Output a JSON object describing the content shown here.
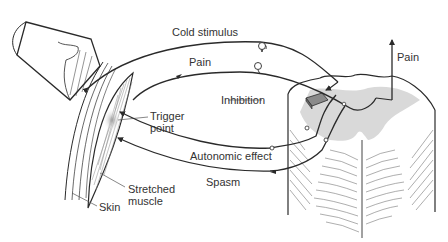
{
  "diagram": {
    "type": "anatomical-pathway-diagram",
    "labels": {
      "cold_stimulus": "Cold stimulus",
      "pain_afferent": "Pain",
      "pain_ascending": "Pain",
      "inhibition": "Inhibition",
      "trigger_point_line1": "Trigger",
      "trigger_point_line2": "point",
      "autonomic_effect": "Autonomic effect",
      "spasm": "Spasm",
      "stretched_muscle_line1": "Stretched",
      "stretched_muscle_line2": "muscle",
      "skin": "Skin"
    },
    "nodes": [
      {
        "id": "ice-cup",
        "label": ""
      },
      {
        "id": "skin",
        "label": "Skin"
      },
      {
        "id": "stretched-muscle",
        "label": "Stretched muscle"
      },
      {
        "id": "trigger-point",
        "label": "Trigger point"
      },
      {
        "id": "spinal-cord",
        "label": ""
      },
      {
        "id": "inhibition-interneuron",
        "label": "Inhibition"
      }
    ],
    "edges": [
      {
        "from": "skin",
        "to": "spinal-cord",
        "label": "Cold stimulus",
        "direction": "afferent"
      },
      {
        "from": "trigger-point",
        "to": "spinal-cord",
        "label": "Pain",
        "direction": "afferent"
      },
      {
        "from": "spinal-cord",
        "to": "brain",
        "label": "Pain",
        "direction": "ascending"
      },
      {
        "from": "spinal-cord",
        "to": "trigger-point",
        "label": "Autonomic effect",
        "direction": "efferent"
      },
      {
        "from": "spinal-cord",
        "to": "stretched-muscle",
        "label": "Spasm",
        "direction": "efferent"
      }
    ],
    "colors": {
      "ink": "#2a2a2a",
      "gray_matter": "#d9d9d9",
      "label_text": "#333333"
    }
  }
}
